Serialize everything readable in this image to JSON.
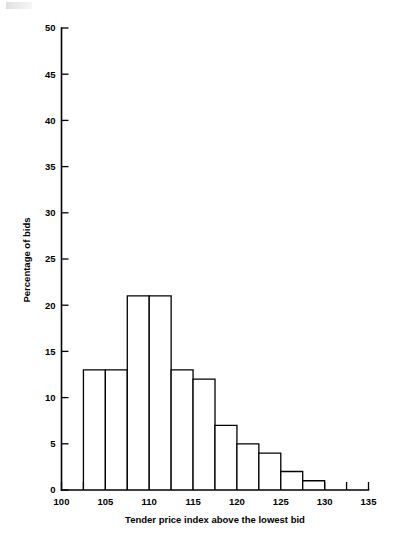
{
  "figure": {
    "background_color": "#ffffff",
    "ink_color": "#000000"
  },
  "chart_data": {
    "type": "bar",
    "title": "",
    "subtitle": "",
    "xlabel": "Tender price index above the lowest bid",
    "ylabel": "Percentage of bids",
    "xlim": [
      100,
      135
    ],
    "ylim": [
      0,
      50
    ],
    "grid": false,
    "legend": null,
    "bin_width": 2.5,
    "bin_edges": [
      102.5,
      105,
      107.5,
      110,
      112.5,
      115,
      117.5,
      120,
      122.5,
      125,
      127.5,
      130
    ],
    "categories": [
      "102.5-105",
      "105-107.5",
      "107.5-110",
      "110-112.5",
      "112.5-115",
      "115-117.5",
      "117.5-120",
      "120-122.5",
      "122.5-125",
      "125-127.5",
      "127.5-130"
    ],
    "values": [
      13,
      13,
      21,
      21,
      13,
      12,
      7,
      5,
      4,
      2,
      1
    ],
    "xticks": [
      100,
      105,
      110,
      115,
      120,
      125,
      130,
      135
    ],
    "xtick_labels": [
      "100",
      "105",
      "110",
      "115",
      "120",
      "125",
      "130",
      "135"
    ],
    "xminor_ticks": [
      102.5,
      107.5,
      112.5,
      117.5,
      122.5,
      127.5,
      132.5
    ],
    "yticks": [
      0,
      5,
      10,
      15,
      20,
      25,
      30,
      35,
      40,
      45,
      50
    ],
    "ytick_labels": [
      "0",
      "5",
      "10",
      "15",
      "20",
      "25",
      "30",
      "35",
      "40",
      "45",
      "50"
    ]
  }
}
